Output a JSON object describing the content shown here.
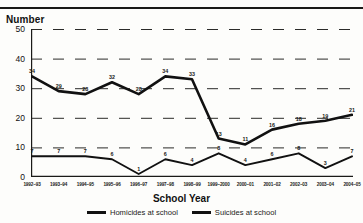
{
  "title": "Homicides and suicides at school",
  "axis": {
    "ylabel": "Number",
    "xlabel": "School Year"
  },
  "legend": [
    {
      "label": "Homicides at school",
      "color": "#111111"
    },
    {
      "label": "Suicides at school",
      "color": "#111111"
    }
  ],
  "chart_data": {
    "type": "line",
    "title": "Homicides and suicides at school",
    "xlabel": "School Year",
    "ylabel": "Number",
    "ylim": [
      0,
      50
    ],
    "yticks": [
      0,
      10,
      20,
      30,
      40,
      50
    ],
    "grid": true,
    "legend_position": "bottom",
    "categories": [
      "1992–93",
      "1993–94",
      "1994–95",
      "1995–96",
      "1996–97",
      "1997–98",
      "1998–99",
      "1999–2000",
      "2000–01",
      "2001–02",
      "2002–03",
      "2003–04",
      "2004–05"
    ],
    "series": [
      {
        "name": "Homicides at school",
        "color": "#111111",
        "values": [
          34,
          29,
          28,
          32,
          28,
          34,
          33,
          13,
          11,
          16,
          18,
          19,
          21
        ]
      },
      {
        "name": "Suicides at school",
        "color": "#111111",
        "values": [
          7,
          7,
          7,
          6,
          1,
          6,
          4,
          8,
          4,
          6,
          8,
          3,
          7
        ]
      }
    ]
  }
}
